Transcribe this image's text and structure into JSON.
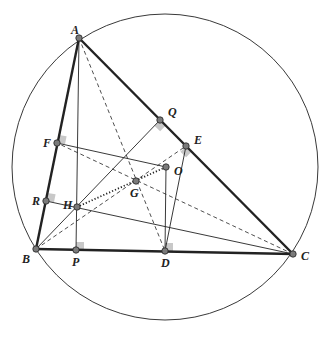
{
  "diagram": {
    "colors": {
      "stroke": "#222222",
      "point_fill": "#7a7a7a",
      "right_angle_fill": "#c8c8c8",
      "background": "#ffffff"
    },
    "points": [
      {
        "id": "A",
        "label": "A"
      },
      {
        "id": "B",
        "label": "B"
      },
      {
        "id": "C",
        "label": "C"
      },
      {
        "id": "Q",
        "label": "Q"
      },
      {
        "id": "E",
        "label": "E"
      },
      {
        "id": "F",
        "label": "F"
      },
      {
        "id": "R",
        "label": "R"
      },
      {
        "id": "H",
        "label": "H"
      },
      {
        "id": "G",
        "label": "G"
      },
      {
        "id": "O",
        "label": "O"
      },
      {
        "id": "P",
        "label": "P"
      },
      {
        "id": "D",
        "label": "D"
      }
    ],
    "segments": [
      {
        "from": "A",
        "to": "B",
        "style": "thick",
        "role": "side"
      },
      {
        "from": "B",
        "to": "C",
        "style": "thick",
        "role": "side"
      },
      {
        "from": "C",
        "to": "A",
        "style": "thick",
        "role": "side"
      },
      {
        "from": "A",
        "to": "P",
        "style": "solid",
        "role": "altitude"
      },
      {
        "from": "B",
        "to": "Q",
        "style": "solid",
        "role": "altitude"
      },
      {
        "from": "C",
        "to": "R",
        "style": "solid",
        "role": "altitude"
      },
      {
        "from": "F",
        "to": "O",
        "style": "solid",
        "role": "perpendicular-bisector"
      },
      {
        "from": "O",
        "to": "D",
        "style": "solid",
        "role": "perpendicular-bisector"
      },
      {
        "from": "D",
        "to": "E",
        "style": "solid",
        "role": "midsegment"
      },
      {
        "from": "A",
        "to": "D",
        "style": "dashed",
        "role": "median"
      },
      {
        "from": "B",
        "to": "E",
        "style": "dashed",
        "role": "median"
      },
      {
        "from": "C",
        "to": "F",
        "style": "dashed",
        "role": "median"
      },
      {
        "from": "H",
        "to": "O",
        "style": "dotted",
        "role": "euler-line"
      }
    ],
    "right_angles": [
      "F",
      "R",
      "P",
      "D",
      "Q",
      "E"
    ],
    "circle": {
      "role": "circumcircle",
      "center": "O"
    }
  }
}
